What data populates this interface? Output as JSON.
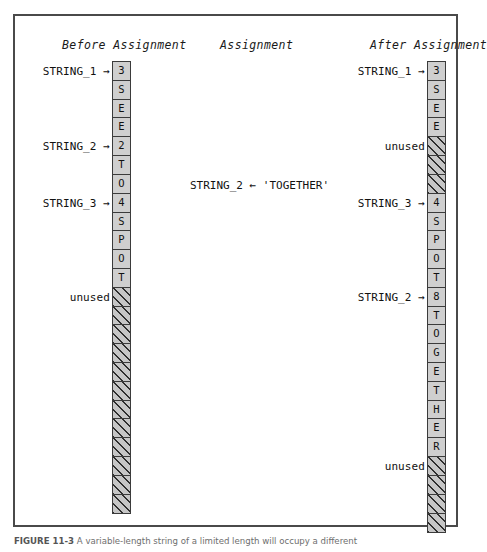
{
  "figure": {
    "caption_label": "FIGURE 11-3",
    "caption_text": "A variable-length string of a limited length will occupy a different"
  },
  "headings": {
    "before": "Before Assignment",
    "middle": "Assignment",
    "after": "After Assignment"
  },
  "assignment": {
    "statement": "STRING_2 ← 'TOGETHER'"
  },
  "labels": {
    "string_1": "STRING_1 →",
    "string_2": "STRING_2 →",
    "string_3": "STRING_3 →",
    "unused": "unused"
  },
  "before_column": {
    "title": "Before Assignment",
    "cells": [
      {
        "value": "3",
        "state": "used"
      },
      {
        "value": "S",
        "state": "used"
      },
      {
        "value": "E",
        "state": "used"
      },
      {
        "value": "E",
        "state": "used"
      },
      {
        "value": "2",
        "state": "used"
      },
      {
        "value": "T",
        "state": "used"
      },
      {
        "value": "O",
        "state": "used"
      },
      {
        "value": "4",
        "state": "used"
      },
      {
        "value": "S",
        "state": "used"
      },
      {
        "value": "P",
        "state": "used"
      },
      {
        "value": "O",
        "state": "used"
      },
      {
        "value": "T",
        "state": "used"
      },
      {
        "value": "",
        "state": "unused"
      },
      {
        "value": "",
        "state": "unused"
      },
      {
        "value": "",
        "state": "unused"
      },
      {
        "value": "",
        "state": "unused"
      },
      {
        "value": "",
        "state": "unused"
      },
      {
        "value": "",
        "state": "unused"
      },
      {
        "value": "",
        "state": "unused"
      },
      {
        "value": "",
        "state": "unused"
      },
      {
        "value": "",
        "state": "unused"
      },
      {
        "value": "",
        "state": "unused"
      },
      {
        "value": "",
        "state": "unused"
      },
      {
        "value": "",
        "state": "unused"
      }
    ],
    "pointers": [
      {
        "label": "STRING_1 →",
        "cell_index": 0
      },
      {
        "label": "STRING_2 →",
        "cell_index": 4
      },
      {
        "label": "STRING_3 →",
        "cell_index": 7
      },
      {
        "label": "unused",
        "cell_index": 12
      }
    ]
  },
  "after_column": {
    "title": "After Assignment",
    "cells": [
      {
        "value": "3",
        "state": "used"
      },
      {
        "value": "S",
        "state": "used"
      },
      {
        "value": "E",
        "state": "used"
      },
      {
        "value": "E",
        "state": "used"
      },
      {
        "value": "",
        "state": "unused"
      },
      {
        "value": "",
        "state": "unused"
      },
      {
        "value": "",
        "state": "unused"
      },
      {
        "value": "4",
        "state": "used"
      },
      {
        "value": "S",
        "state": "used"
      },
      {
        "value": "P",
        "state": "used"
      },
      {
        "value": "O",
        "state": "used"
      },
      {
        "value": "T",
        "state": "used"
      },
      {
        "value": "8",
        "state": "used"
      },
      {
        "value": "T",
        "state": "used"
      },
      {
        "value": "O",
        "state": "used"
      },
      {
        "value": "G",
        "state": "used"
      },
      {
        "value": "E",
        "state": "used"
      },
      {
        "value": "T",
        "state": "used"
      },
      {
        "value": "H",
        "state": "used"
      },
      {
        "value": "E",
        "state": "used"
      },
      {
        "value": "R",
        "state": "used"
      },
      {
        "value": "",
        "state": "unused"
      },
      {
        "value": "",
        "state": "unused"
      },
      {
        "value": "",
        "state": "unused"
      },
      {
        "value": "",
        "state": "unused"
      }
    ],
    "pointers": [
      {
        "label": "STRING_1 →",
        "cell_index": 0
      },
      {
        "label": "unused",
        "cell_index": 4
      },
      {
        "label": "STRING_3 →",
        "cell_index": 7
      },
      {
        "label": "STRING_2 →",
        "cell_index": 12
      },
      {
        "label": "unused",
        "cell_index": 21
      }
    ]
  }
}
